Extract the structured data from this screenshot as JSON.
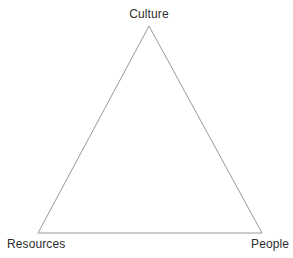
{
  "diagram": {
    "type": "triangle-diagram",
    "background_color": "#ffffff",
    "stroke_color": "#9a9a9a",
    "text_color": "#2e2e2e",
    "vertices": [
      {
        "id": "apex",
        "label": "Culture",
        "x": 149,
        "y": 26
      },
      {
        "id": "bottom-left",
        "label": "Resources",
        "x": 38,
        "y": 233
      },
      {
        "id": "bottom-right",
        "label": "People",
        "x": 262,
        "y": 233
      }
    ],
    "labels": {
      "top": "Culture",
      "bottom_left": "Resources",
      "bottom_right": "People"
    }
  }
}
